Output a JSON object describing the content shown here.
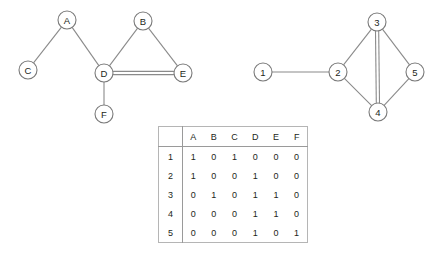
{
  "figure": {
    "background_color": "#ffffff",
    "line_color": "#8a8a8a",
    "node_fill": "#ffffff",
    "text_color": "#231f20"
  },
  "graph_left": {
    "name": "letter-graph",
    "nodes": [
      {
        "id": "A",
        "label": "A",
        "cx": 67,
        "cy": 20
      },
      {
        "id": "B",
        "label": "B",
        "cx": 143,
        "cy": 21
      },
      {
        "id": "C",
        "label": "C",
        "cx": 28,
        "cy": 70
      },
      {
        "id": "D",
        "label": "D",
        "cx": 104,
        "cy": 73
      },
      {
        "id": "E",
        "label": "E",
        "cx": 183,
        "cy": 73
      },
      {
        "id": "F",
        "label": "F",
        "cx": 104,
        "cy": 114
      }
    ],
    "edges": [
      {
        "from": "A",
        "to": "C",
        "multiplicity": 1
      },
      {
        "from": "A",
        "to": "D",
        "multiplicity": 1
      },
      {
        "from": "B",
        "to": "D",
        "multiplicity": 1
      },
      {
        "from": "B",
        "to": "E",
        "multiplicity": 1
      },
      {
        "from": "D",
        "to": "E",
        "multiplicity": 2
      },
      {
        "from": "D",
        "to": "F",
        "multiplicity": 1
      }
    ]
  },
  "graph_right": {
    "name": "number-graph",
    "nodes": [
      {
        "id": "1",
        "label": "1",
        "cx": 263,
        "cy": 72
      },
      {
        "id": "2",
        "label": "2",
        "cx": 338,
        "cy": 72
      },
      {
        "id": "3",
        "label": "3",
        "cx": 377,
        "cy": 22
      },
      {
        "id": "4",
        "label": "4",
        "cx": 378,
        "cy": 112
      },
      {
        "id": "5",
        "label": "5",
        "cx": 415,
        "cy": 72
      }
    ],
    "edges": [
      {
        "from": "1",
        "to": "2",
        "multiplicity": 1
      },
      {
        "from": "2",
        "to": "3",
        "multiplicity": 1
      },
      {
        "from": "2",
        "to": "4",
        "multiplicity": 1
      },
      {
        "from": "3",
        "to": "4",
        "multiplicity": 2
      },
      {
        "from": "3",
        "to": "5",
        "multiplicity": 1
      },
      {
        "from": "4",
        "to": "5",
        "multiplicity": 1
      }
    ]
  },
  "matrix": {
    "corner_label": "",
    "columns": [
      "A",
      "B",
      "C",
      "D",
      "E",
      "F"
    ],
    "rows": [
      {
        "label": "1",
        "values": [
          "1",
          "0",
          "1",
          "0",
          "0",
          "0"
        ]
      },
      {
        "label": "2",
        "values": [
          "1",
          "0",
          "0",
          "1",
          "0",
          "0"
        ]
      },
      {
        "label": "3",
        "values": [
          "0",
          "1",
          "0",
          "1",
          "1",
          "0"
        ]
      },
      {
        "label": "4",
        "values": [
          "0",
          "0",
          "0",
          "1",
          "1",
          "0"
        ]
      },
      {
        "label": "5",
        "values": [
          "0",
          "0",
          "0",
          "1",
          "0",
          "1"
        ]
      }
    ]
  }
}
